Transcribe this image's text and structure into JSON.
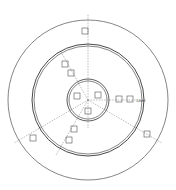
{
  "diagram": {
    "type": "concentric sensor layout",
    "center": [
      88,
      100
    ],
    "rings": [
      {
        "name": "outer-ring",
        "radius": 80
      },
      {
        "name": "middle-ring-outer",
        "radius": 56
      },
      {
        "name": "middle-ring-inner",
        "radius": 54
      },
      {
        "name": "inner-ring-outer",
        "radius": 21
      },
      {
        "name": "inner-ring-inner",
        "radius": 19
      }
    ],
    "axes": [
      {
        "label": "0",
        "angle": -90
      },
      {
        "label": "60",
        "angle": -120
      },
      {
        "label": "120m",
        "angle": 0
      },
      {
        "label": "240",
        "angle": 150
      },
      {
        "label": "300",
        "angle": 30
      },
      {
        "label": "180",
        "angle": 90
      }
    ],
    "dimension_label": "120m",
    "colors": {
      "line": "#333333",
      "dash": "#555555",
      "background": "#ffffff"
    }
  }
}
